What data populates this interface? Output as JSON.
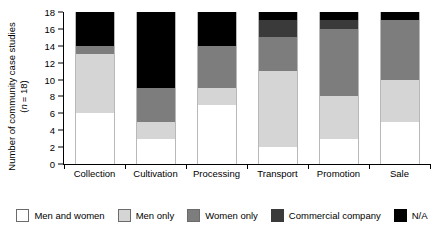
{
  "chart_data": {
    "type": "bar",
    "stacked": true,
    "title": "",
    "xlabel": "",
    "ylabel": "Number of community case studies (n = 18)",
    "ylabel_line1": "Number of community case studies",
    "ylabel_line2": "(n = 18)",
    "n_label": "n",
    "n_value": "= 18)",
    "ylim": [
      0,
      18
    ],
    "ytick_step": 2,
    "yticks": [
      0,
      2,
      4,
      6,
      8,
      10,
      12,
      14,
      16,
      18
    ],
    "ytick_labels": [
      "0",
      "2",
      "4",
      "6",
      "8",
      "10",
      "12",
      "14",
      "16",
      "18"
    ],
    "grid": false,
    "legend_position": "bottom",
    "categories": [
      "Collection",
      "Cultivation",
      "Processing",
      "Transport",
      "Promotion",
      "Sale"
    ],
    "series": [
      {
        "name": "Men and women",
        "color": "#ffffff",
        "values": [
          6,
          3,
          7,
          2,
          3,
          5
        ]
      },
      {
        "name": "Men only",
        "color": "#d5d5d5",
        "values": [
          7,
          2,
          2,
          9,
          5,
          5
        ]
      },
      {
        "name": "Women only",
        "color": "#7d7d7d",
        "values": [
          1,
          4,
          5,
          4,
          8,
          7
        ]
      },
      {
        "name": "Commercial company",
        "color": "#3a3a3a",
        "values": [
          0,
          0,
          0,
          2,
          1,
          0
        ]
      },
      {
        "name": "N/A",
        "color": "#000000",
        "values": [
          4,
          9,
          4,
          1,
          1,
          1
        ]
      }
    ],
    "totals": [
      18,
      18,
      18,
      18,
      18,
      18
    ]
  },
  "legend": {
    "items": [
      {
        "label": "Men and women",
        "color": "#ffffff"
      },
      {
        "label": "Men only",
        "color": "#d5d5d5"
      },
      {
        "label": "Women only",
        "color": "#7d7d7d"
      },
      {
        "label": "Commercial company",
        "color": "#3a3a3a"
      },
      {
        "label": "N/A",
        "color": "#000000"
      }
    ]
  }
}
